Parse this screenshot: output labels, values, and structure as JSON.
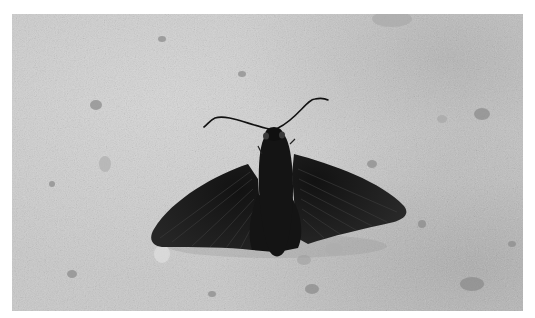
{
  "image": {
    "description": "Black-and-white photograph of a dark butterfly with spread wings resting on sandy, pebbly ground",
    "subject": "dark butterfly (skipper) with curved antennae",
    "background": "light gray gravel and sand",
    "colors": {
      "page_background": "#ffffff",
      "ground": "#c9c9c9",
      "ground_shadow": "#9a9a9a",
      "wing": "#1e1e1e",
      "wing_vein": "#3a3a3a",
      "body": "#141414"
    }
  },
  "caption_fragment": ""
}
